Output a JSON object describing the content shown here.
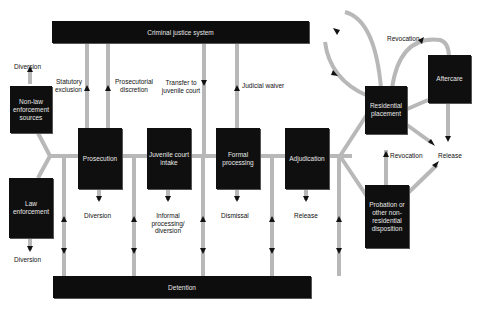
{
  "diagram": {
    "top_bar": {
      "label": "Criminal justice system"
    },
    "bottom_bar": {
      "label": "Detention"
    },
    "nodes": {
      "non_law": "Non-law enforcement sources",
      "law": "Law enforcement",
      "prosecution": "Prosecution",
      "intake": "Juvenile court intake",
      "formal": "Formal processing",
      "adjudication": "Adjudication",
      "residential": "Residential placement",
      "aftercare": "Aftercare",
      "probation": "Probation or other non-residential disposition"
    },
    "labels": {
      "diversion_top": "Diversion",
      "diversion_bottom": "Diversion",
      "statutory": "Statutory exclusion",
      "prosecutorial": "Prosecutorial discretion",
      "transfer": "Transfer to juvenile court",
      "waiver": "Judicial waiver",
      "pros_diversion": "Diversion",
      "informal": "Informal processing/ diversion",
      "dismissal": "Dismissal",
      "release_adj": "Release",
      "revocation_top": "Revocation",
      "revocation_mid": "Revocation",
      "release_right": "Release"
    },
    "colors": {
      "box": "#0f0f0f",
      "line": "#b8b8b8",
      "arrow": "#111111",
      "text_on_box": "#e8e8e8"
    }
  }
}
